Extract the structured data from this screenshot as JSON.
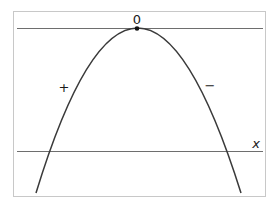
{
  "diagram": {
    "vertex_label": "0",
    "left_sign_label": "+",
    "right_sign_label": "−",
    "axis_label": "x",
    "colors": {
      "frame": "#c8c8c8",
      "lines": "#6e6e6e",
      "curve": "#3a3a3a",
      "text": "#1a1a1a"
    }
  }
}
